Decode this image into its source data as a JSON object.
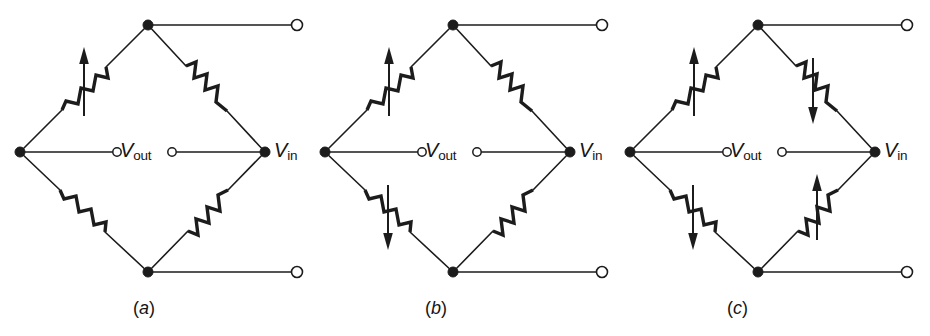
{
  "figure": {
    "width": 930,
    "height": 336,
    "background": "#ffffff",
    "ink_color": "#1c1c1c",
    "panels": [
      {
        "id": "panel-a",
        "caption": "(a)",
        "caption_letter": "a",
        "caption_x": 148,
        "caption_y": 300,
        "origin_x": 20,
        "vout_label_v": "V",
        "vout_label_sub": "out",
        "vin_label_v": "V",
        "vin_label_sub": "in",
        "active_arms": 1,
        "arms": [
          {
            "name": "top-left",
            "active": true,
            "arrow": "up",
            "arrow_dir": "↑"
          },
          {
            "name": "top-right",
            "active": false,
            "arrow": "none",
            "arrow_dir": ""
          },
          {
            "name": "bottom-left",
            "active": false,
            "arrow": "none",
            "arrow_dir": ""
          },
          {
            "name": "bottom-right",
            "active": false,
            "arrow": "none",
            "arrow_dir": ""
          }
        ]
      },
      {
        "id": "panel-b",
        "caption": "(b)",
        "caption_letter": "b",
        "caption_x": 440,
        "caption_y": 300,
        "origin_x": 325,
        "vout_label_v": "V",
        "vout_label_sub": "out",
        "vin_label_v": "V",
        "vin_label_sub": "in",
        "active_arms": 2,
        "arms": [
          {
            "name": "top-left",
            "active": true,
            "arrow": "up",
            "arrow_dir": "↑"
          },
          {
            "name": "top-right",
            "active": false,
            "arrow": "none",
            "arrow_dir": ""
          },
          {
            "name": "bottom-left",
            "active": true,
            "arrow": "down",
            "arrow_dir": "↓"
          },
          {
            "name": "bottom-right",
            "active": false,
            "arrow": "none",
            "arrow_dir": ""
          }
        ]
      },
      {
        "id": "panel-c",
        "caption": "(c)",
        "caption_letter": "c",
        "caption_x": 742,
        "caption_y": 300,
        "origin_x": 630,
        "vout_label_v": "V",
        "vout_label_sub": "out",
        "vin_label_v": "V",
        "vin_label_sub": "in",
        "active_arms": 4,
        "arms": [
          {
            "name": "top-left",
            "active": true,
            "arrow": "up",
            "arrow_dir": "↑"
          },
          {
            "name": "top-right",
            "active": true,
            "arrow": "down",
            "arrow_dir": "↓"
          },
          {
            "name": "bottom-left",
            "active": true,
            "arrow": "down",
            "arrow_dir": "↓"
          },
          {
            "name": "bottom-right",
            "active": true,
            "arrow": "up",
            "arrow_dir": "↑"
          }
        ]
      }
    ],
    "geometry": {
      "apex_dx": 128,
      "apex_y": 25,
      "mid_y": 152,
      "right_dx": 245,
      "bottom_y": 272,
      "lead_end_dx": 277,
      "node_radius": 5,
      "terminal_radius": 5.5,
      "vout_terminal_radius": 4.2,
      "vout_left_dx": 97,
      "vout_right_dx": 152
    }
  }
}
